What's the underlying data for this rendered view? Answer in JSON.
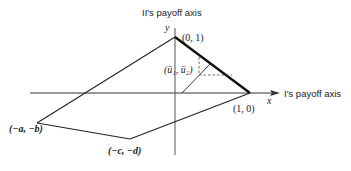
{
  "diagram": {
    "axes": {
      "y_axis_title": "II's payoff axis",
      "x_axis_title": "I's payoff axis",
      "x_symbol": "x",
      "y_symbol": "y"
    },
    "points": {
      "top": "(0, 1)",
      "right": "(1, 0)",
      "left": "(−a, −b)",
      "bottom": "(−c, −d)",
      "interior": "(ū₁, ū₂)"
    },
    "colors": {
      "line": "#222222",
      "background": "#ffffff"
    }
  }
}
